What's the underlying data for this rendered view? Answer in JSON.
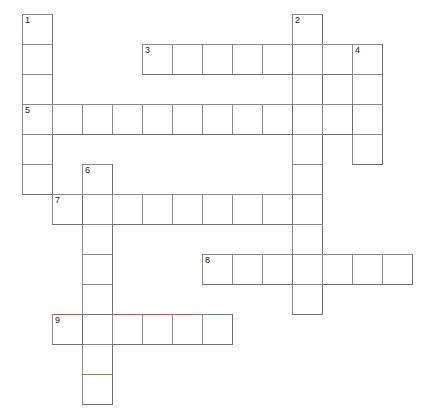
{
  "puzzle": {
    "type": "crossword-grid",
    "title": "Crossword puzzle grid",
    "cell_size": 30,
    "grid_origin": {
      "x": 22,
      "y": 14
    },
    "colors": {
      "background": "#ffffff",
      "cell_fill": "#ffffff",
      "grid_line": "#6e6e6e",
      "grid_line_light": "#8a8a8a",
      "number_text": "#1a1a1a",
      "tint_red": "#c8524f",
      "tint_olive": "#8a8a2e",
      "tint_teal": "#4f8a8a"
    },
    "entries": [
      {
        "number": "1",
        "direction": "down",
        "col": 0,
        "row": 0,
        "length": 6
      },
      {
        "number": "2",
        "direction": "down",
        "col": 9,
        "row": 0,
        "length": 10
      },
      {
        "number": "3",
        "direction": "across",
        "col": 4,
        "row": 1,
        "length": 8
      },
      {
        "number": "4",
        "direction": "down",
        "col": 11,
        "row": 1,
        "length": 4
      },
      {
        "number": "5",
        "direction": "across",
        "col": 0,
        "row": 3,
        "length": 12
      },
      {
        "number": "6",
        "direction": "down",
        "col": 2,
        "row": 5,
        "length": 8
      },
      {
        "number": "7",
        "direction": "across",
        "col": 1,
        "row": 6,
        "length": 9
      },
      {
        "number": "8",
        "direction": "across",
        "col": 6,
        "row": 8,
        "length": 7
      },
      {
        "number": "9",
        "direction": "across",
        "col": 1,
        "row": 10,
        "length": 6
      }
    ],
    "cells": [
      {
        "col": 0,
        "row": 0,
        "number": "1",
        "tint": ""
      },
      {
        "col": 0,
        "row": 1,
        "number": "",
        "tint": ""
      },
      {
        "col": 0,
        "row": 2,
        "number": "",
        "tint": ""
      },
      {
        "col": 0,
        "row": 3,
        "number": "5",
        "tint": ""
      },
      {
        "col": 0,
        "row": 4,
        "number": "",
        "tint": ""
      },
      {
        "col": 0,
        "row": 5,
        "number": "",
        "tint": ""
      },
      {
        "col": 9,
        "row": 0,
        "number": "2",
        "tint": ""
      },
      {
        "col": 9,
        "row": 1,
        "number": "",
        "tint": ""
      },
      {
        "col": 9,
        "row": 2,
        "number": "",
        "tint": ""
      },
      {
        "col": 9,
        "row": 3,
        "number": "",
        "tint": ""
      },
      {
        "col": 9,
        "row": 4,
        "number": "",
        "tint": ""
      },
      {
        "col": 9,
        "row": 5,
        "number": "",
        "tint": ""
      },
      {
        "col": 9,
        "row": 6,
        "number": "",
        "tint": ""
      },
      {
        "col": 9,
        "row": 7,
        "number": "",
        "tint": ""
      },
      {
        "col": 9,
        "row": 8,
        "number": "",
        "tint": ""
      },
      {
        "col": 9,
        "row": 9,
        "number": "",
        "tint": ""
      },
      {
        "col": 4,
        "row": 1,
        "number": "3",
        "tint": ""
      },
      {
        "col": 5,
        "row": 1,
        "number": "",
        "tint": ""
      },
      {
        "col": 6,
        "row": 1,
        "number": "",
        "tint": ""
      },
      {
        "col": 7,
        "row": 1,
        "number": "",
        "tint": ""
      },
      {
        "col": 8,
        "row": 1,
        "number": "",
        "tint": ""
      },
      {
        "col": 10,
        "row": 1,
        "number": "",
        "tint": ""
      },
      {
        "col": 11,
        "row": 1,
        "number": "4",
        "tint": ""
      },
      {
        "col": 11,
        "row": 2,
        "number": "",
        "tint": ""
      },
      {
        "col": 11,
        "row": 3,
        "number": "",
        "tint": ""
      },
      {
        "col": 11,
        "row": 4,
        "number": "",
        "tint": ""
      },
      {
        "col": 1,
        "row": 3,
        "number": "",
        "tint": ""
      },
      {
        "col": 2,
        "row": 3,
        "number": "",
        "tint": ""
      },
      {
        "col": 3,
        "row": 3,
        "number": "",
        "tint": ""
      },
      {
        "col": 4,
        "row": 3,
        "number": "",
        "tint": ""
      },
      {
        "col": 5,
        "row": 3,
        "number": "",
        "tint": ""
      },
      {
        "col": 6,
        "row": 3,
        "number": "",
        "tint": ""
      },
      {
        "col": 7,
        "row": 3,
        "number": "",
        "tint": ""
      },
      {
        "col": 8,
        "row": 3,
        "number": "",
        "tint": ""
      },
      {
        "col": 10,
        "row": 3,
        "number": "",
        "tint": ""
      },
      {
        "col": 2,
        "row": 5,
        "number": "6",
        "tint": ""
      },
      {
        "col": 2,
        "row": 6,
        "number": "",
        "tint": ""
      },
      {
        "col": 2,
        "row": 7,
        "number": "",
        "tint": ""
      },
      {
        "col": 2,
        "row": 8,
        "number": "",
        "tint": ""
      },
      {
        "col": 2,
        "row": 9,
        "number": "",
        "tint": ""
      },
      {
        "col": 2,
        "row": 11,
        "number": "",
        "tint": ""
      },
      {
        "col": 2,
        "row": 12,
        "number": "",
        "tint": "olive"
      },
      {
        "col": 1,
        "row": 6,
        "number": "7",
        "tint": ""
      },
      {
        "col": 3,
        "row": 6,
        "number": "",
        "tint": ""
      },
      {
        "col": 4,
        "row": 6,
        "number": "",
        "tint": ""
      },
      {
        "col": 5,
        "row": 6,
        "number": "",
        "tint": ""
      },
      {
        "col": 6,
        "row": 6,
        "number": "",
        "tint": ""
      },
      {
        "col": 7,
        "row": 6,
        "number": "",
        "tint": ""
      },
      {
        "col": 8,
        "row": 6,
        "number": "",
        "tint": ""
      },
      {
        "col": 6,
        "row": 8,
        "number": "8",
        "tint": ""
      },
      {
        "col": 7,
        "row": 8,
        "number": "",
        "tint": ""
      },
      {
        "col": 8,
        "row": 8,
        "number": "",
        "tint": ""
      },
      {
        "col": 10,
        "row": 8,
        "number": "",
        "tint": ""
      },
      {
        "col": 11,
        "row": 8,
        "number": "",
        "tint": ""
      },
      {
        "col": 12,
        "row": 8,
        "number": "",
        "tint": ""
      },
      {
        "col": 1,
        "row": 10,
        "number": "9",
        "tint": "red"
      },
      {
        "col": 3,
        "row": 10,
        "number": "",
        "tint": "red"
      },
      {
        "col": 4,
        "row": 10,
        "number": "",
        "tint": "red"
      },
      {
        "col": 5,
        "row": 10,
        "number": "",
        "tint": "red"
      },
      {
        "col": 6,
        "row": 10,
        "number": "",
        "tint": "teal"
      }
    ]
  }
}
